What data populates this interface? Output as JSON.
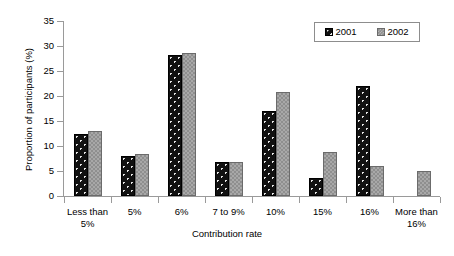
{
  "chart_data": {
    "type": "bar",
    "title": "",
    "xlabel": "Contribution rate",
    "ylabel": "Proportion of participants (%)",
    "categories": [
      "Less than 5%",
      "5%",
      "6%",
      "7 to 9%",
      "10%",
      "15%",
      "16%",
      "More than 16%"
    ],
    "category_lines": [
      [
        "Less than",
        "5%"
      ],
      [
        "5%"
      ],
      [
        "6%"
      ],
      [
        "7 to 9%"
      ],
      [
        "10%"
      ],
      [
        "15%"
      ],
      [
        "16%"
      ],
      [
        "More than",
        "16%"
      ]
    ],
    "series": [
      {
        "name": "2001",
        "color": "#111111",
        "values": [
          12.4,
          8.0,
          28.2,
          6.8,
          17.0,
          3.6,
          22.0,
          0
        ]
      },
      {
        "name": "2002",
        "color": "#8f8f8f",
        "values": [
          13.0,
          8.4,
          28.6,
          6.8,
          20.8,
          8.8,
          6.0,
          5.0
        ]
      }
    ],
    "ylim": [
      0,
      35
    ],
    "yticks": [
      0,
      5,
      10,
      15,
      20,
      25,
      30,
      35
    ],
    "ytick_labels": [
      "0",
      "5",
      "10",
      "15",
      "20",
      "25",
      "30",
      "35"
    ],
    "grid": false,
    "legend_position": "top-right",
    "legend_entries": [
      "2001",
      "2002"
    ]
  }
}
